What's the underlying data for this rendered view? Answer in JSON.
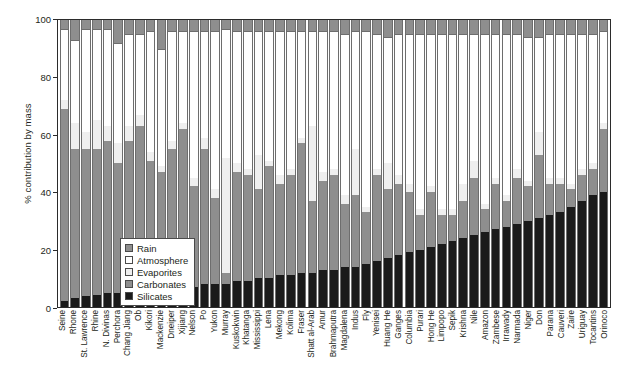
{
  "chart_data": {
    "type": "bar",
    "stacked": true,
    "title": "",
    "xlabel": "",
    "ylabel": "% contribution by mass",
    "ylim": [
      0,
      100
    ],
    "yticks": [
      0,
      20,
      40,
      60,
      80,
      100
    ],
    "ytick_labels": [
      "0",
      "20",
      "40",
      "60",
      "80",
      "100"
    ],
    "grid": false,
    "legend_position": "inside-lower-left",
    "legend_entries": [
      "Rain",
      "Atmosphere",
      "Evaporites",
      "Carbonates",
      "Silicates"
    ],
    "series_colors": {
      "Rain": "#8e8e8e",
      "Atmosphere": "#ffffff",
      "Evaporites": "#efefef",
      "Carbonates": "#8e8e8e",
      "Silicates": "#1a1a1a"
    },
    "categories": [
      "Seine",
      "Rhone",
      "St. Lawrence",
      "Rhine",
      "N. Divinas",
      "Perchora",
      "Chang Jiang",
      "Ob",
      "Kikori",
      "Mackenzie",
      "Dneiper",
      "Xijiang",
      "Nelson",
      "Po",
      "Yukon",
      "Murray",
      "Kuskokwin",
      "Khatanga",
      "Mississippi",
      "Lena",
      "Mekong",
      "Kolima",
      "Fraser",
      "Shatt al-Arab",
      "Amur",
      "Brahmaputra",
      "Magdalena",
      "Indus",
      "Fly",
      "Yenisei",
      "Huang He",
      "Ganges",
      "Columbia",
      "Purari",
      "Hong He",
      "Limpopo",
      "Sepik",
      "Krishna",
      "Nile",
      "Amazon",
      "Zambese",
      "Irrawady",
      "Narmada",
      "Niger",
      "Don",
      "Parana",
      "Cauveri",
      "Zaire",
      "Uriguay",
      "Tocantins",
      "Orinoco"
    ],
    "series": [
      {
        "name": "Silicates",
        "values": [
          2,
          3,
          4,
          4,
          5,
          5,
          5,
          6,
          6,
          6,
          7,
          7,
          7,
          8,
          8,
          8,
          9,
          9,
          10,
          10,
          11,
          11,
          12,
          12,
          13,
          13,
          14,
          14,
          15,
          16,
          17,
          18,
          19,
          20,
          21,
          22,
          23,
          24,
          25,
          26,
          27,
          28,
          29,
          30,
          31,
          32,
          33,
          35,
          37,
          39,
          40
        ]
      },
      {
        "name": "Carbonates",
        "values": [
          67,
          52,
          51,
          51,
          53,
          45,
          53,
          57,
          45,
          41,
          48,
          55,
          35,
          47,
          30,
          4,
          38,
          37,
          31,
          39,
          32,
          35,
          45,
          25,
          31,
          33,
          22,
          25,
          18,
          30,
          24,
          25,
          21,
          12,
          19,
          10,
          9,
          13,
          20,
          8,
          16,
          9,
          16,
          12,
          22,
          11,
          10,
          6,
          9,
          9,
          22
        ]
      },
      {
        "name": "Evaporites",
        "values": [
          3,
          9,
          6,
          10,
          5,
          7,
          5,
          4,
          3,
          2,
          3,
          2,
          3,
          4,
          3,
          40,
          3,
          2,
          12,
          2,
          3,
          2,
          2,
          26,
          3,
          2,
          3,
          16,
          2,
          2,
          9,
          3,
          3,
          2,
          2,
          2,
          2,
          6,
          6,
          2,
          2,
          2,
          3,
          2,
          8,
          2,
          2,
          2,
          2,
          2,
          2
        ]
      },
      {
        "name": "Atmosphere",
        "values": [
          25,
          29,
          36,
          32,
          34,
          35,
          32,
          28,
          42,
          41,
          38,
          32,
          51,
          37,
          55,
          45,
          46,
          48,
          43,
          45,
          50,
          48,
          37,
          33,
          49,
          48,
          56,
          41,
          61,
          47,
          44,
          49,
          52,
          61,
          53,
          61,
          61,
          52,
          44,
          59,
          50,
          56,
          47,
          50,
          33,
          50,
          50,
          52,
          47,
          45,
          32
        ]
      },
      {
        "name": "Rain",
        "values": [
          3,
          7,
          3,
          3,
          3,
          8,
          5,
          5,
          4,
          10,
          4,
          4,
          4,
          4,
          4,
          3,
          4,
          4,
          4,
          4,
          4,
          4,
          4,
          4,
          4,
          4,
          5,
          4,
          4,
          5,
          6,
          5,
          5,
          5,
          5,
          5,
          5,
          5,
          5,
          5,
          5,
          5,
          5,
          6,
          6,
          5,
          5,
          5,
          5,
          5,
          4
        ]
      }
    ]
  },
  "legend": {
    "items": [
      {
        "label": "Rain",
        "color": "#8e8e8e"
      },
      {
        "label": "Atmosphere",
        "color": "#ffffff"
      },
      {
        "label": "Evaporites",
        "color": "#efefef"
      },
      {
        "label": "Carbonates",
        "color": "#8e8e8e"
      },
      {
        "label": "Silicates",
        "color": "#1a1a1a"
      }
    ]
  }
}
